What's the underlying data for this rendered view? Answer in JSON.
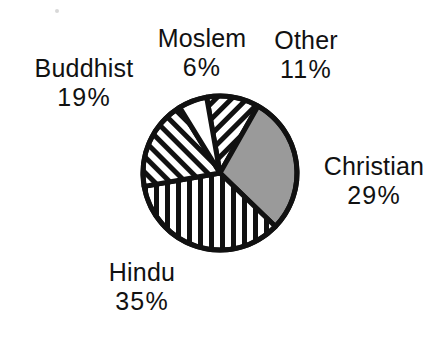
{
  "figure": {
    "background_color": "#ffffff",
    "ink_color": "#111111"
  },
  "chart_data": {
    "type": "pie",
    "title": "",
    "subtitle": "",
    "xlabel": "",
    "ylabel": "",
    "legend_position": "outside-callout-labels",
    "grid": false,
    "start_angle_deg": -10,
    "direction": "clockwise",
    "center": {
      "x": 220,
      "y": 173
    },
    "radius": 77,
    "categories": [
      "Other",
      "Christian",
      "Hindu",
      "Buddhist",
      "Moslem"
    ],
    "values": [
      11,
      29,
      35,
      19,
      6
    ],
    "units": "percent",
    "total": 100,
    "slices": [
      {
        "name": "Other",
        "label": "Other",
        "value": 11,
        "value_text": "11%",
        "fill": "diagonal-stripes-down-left",
        "fill_color": "#ffffff",
        "stroke_color": "#111111"
      },
      {
        "name": "Christian",
        "label": "Christian",
        "value": 29,
        "value_text": "29%",
        "fill": "solid-gray",
        "fill_color": "#9a9a9a",
        "stroke_color": "#111111"
      },
      {
        "name": "Hindu",
        "label": "Hindu",
        "value": 35,
        "value_text": "35%",
        "fill": "vertical-stripes",
        "fill_color": "#ffffff",
        "stroke_color": "#111111"
      },
      {
        "name": "Buddhist",
        "label": "Buddhist",
        "value": 19,
        "value_text": "19%",
        "fill": "diagonal-stripes-down-right",
        "fill_color": "#ffffff",
        "stroke_color": "#111111"
      },
      {
        "name": "Moslem",
        "label": "Moslem",
        "value": 6,
        "value_text": "6%",
        "fill": "blank-white",
        "fill_color": "#ffffff",
        "stroke_color": "#111111"
      }
    ]
  },
  "labels": {
    "buddhist": {
      "name": "Buddhist",
      "percent": "19%"
    },
    "moslem": {
      "name": "Moslem",
      "percent": "6%"
    },
    "other": {
      "name": "Other",
      "percent": "11%"
    },
    "christian": {
      "name": "Christian",
      "percent": "29%"
    },
    "hindu": {
      "name": "Hindu",
      "percent": "35%"
    }
  }
}
